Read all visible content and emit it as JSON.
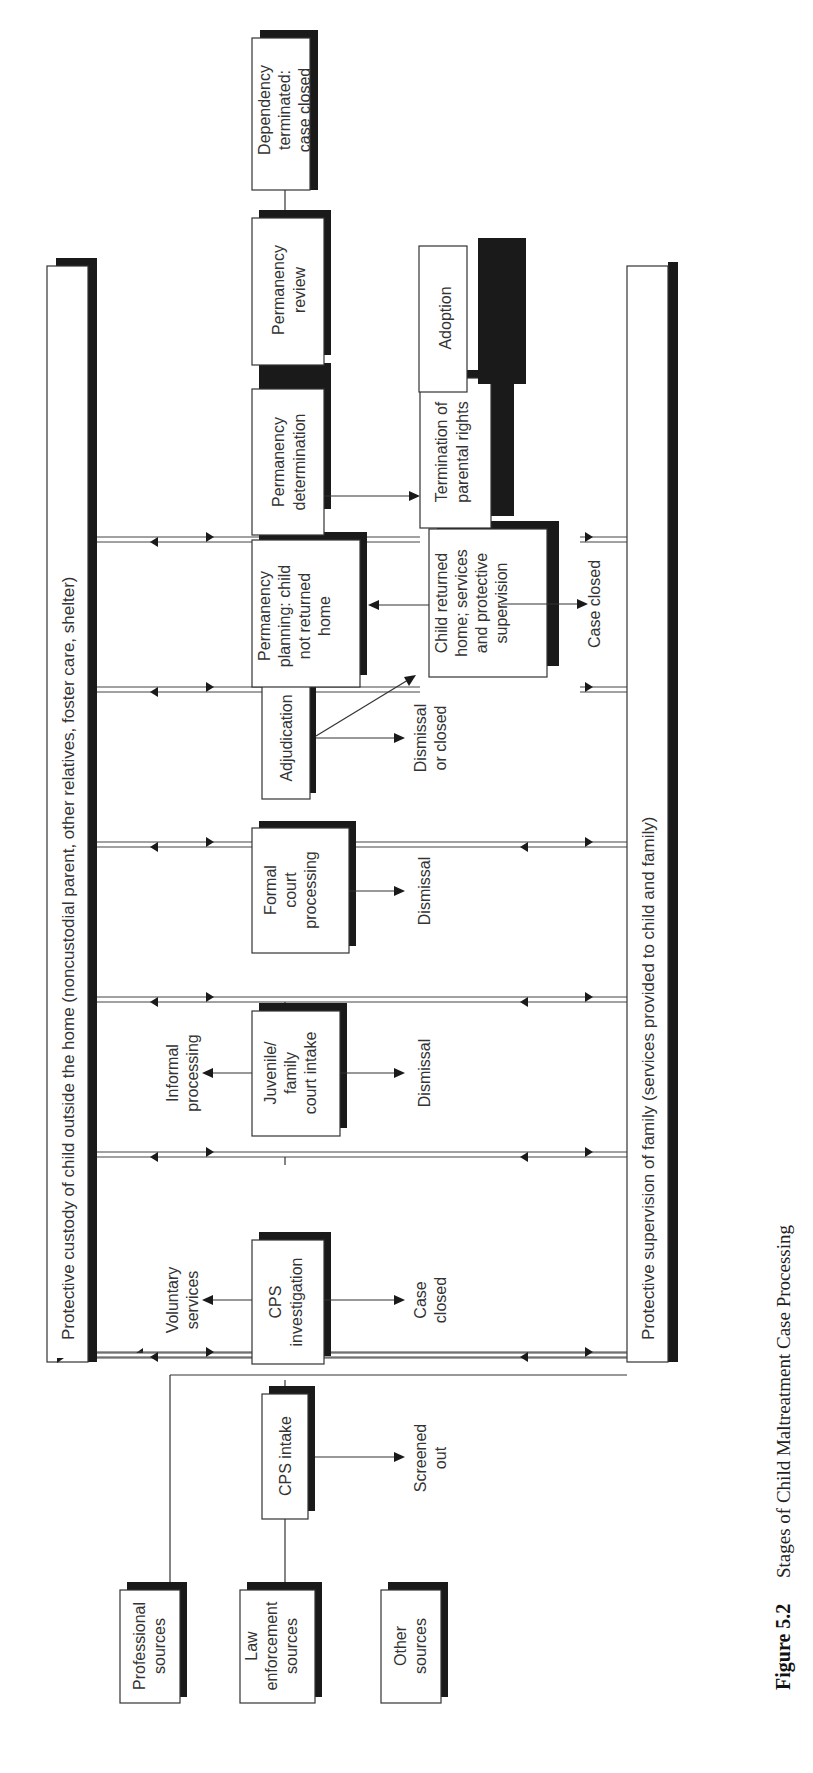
{
  "figure": {
    "number": "Figure 5.2",
    "caption": "Stages of Child Maltreatment Case Processing",
    "orientation": "rotated 90° counter-clockwise"
  },
  "bars": {
    "top": "Protective custody of child outside the home (noncustodial parent, other relatives, foster care, shelter)",
    "bottom": "Protective supervision of family (services provided to child and family)"
  },
  "sources": [
    {
      "line1": "Professional",
      "line2": "sources",
      "line3": ""
    },
    {
      "line1": "Law",
      "line2": "enforcement",
      "line3": "sources"
    },
    {
      "line1": "Other",
      "line2": "sources",
      "line3": ""
    }
  ],
  "stages": {
    "cps_intake": {
      "line1": "CPS intake"
    },
    "cps_investigation": {
      "line1": "CPS",
      "line2": "investigation"
    },
    "juvenile_court_intake": {
      "line1": "Juvenile/",
      "line2": "family",
      "line3": "court intake"
    },
    "formal_court_processing": {
      "line1": "Formal",
      "line2": "court",
      "line3": "processing"
    },
    "adjudication": {
      "line1": "Adjudication"
    },
    "permanency_planning": {
      "line1": "Permanency",
      "line2": "planning: child",
      "line3": "not returned",
      "line4": "home"
    },
    "permanency_determination": {
      "line1": "Permanency",
      "line2": "determination"
    },
    "permanency_review": {
      "line1": "Permanency",
      "line2": "review"
    },
    "dependency_terminated": {
      "line1": "Dependency",
      "line2": "terminated:",
      "line3": "case closed"
    },
    "child_returned_home": {
      "line1": "Child returned",
      "line2": "home; services",
      "line3": "and protective",
      "line4": "supervision"
    },
    "termination_parental_rights": {
      "line1": "Termination of",
      "line2": "parental rights"
    },
    "adoption": {
      "line1": "Adoption"
    }
  },
  "outcomes": {
    "screened_out": {
      "line1": "Screened",
      "line2": "out"
    },
    "case_closed_investigation": {
      "line1": "Case",
      "line2": "closed"
    },
    "voluntary_services": {
      "line1": "Voluntary",
      "line2": "services"
    },
    "informal_processing": {
      "line1": "Informal",
      "line2": "processing"
    },
    "dismissal_intake": {
      "line1": "Dismissal"
    },
    "dismissal_formal": {
      "line1": "Dismissal"
    },
    "dismissal_or_closed": {
      "line1": "Dismissal",
      "line2": "or closed"
    },
    "case_closed_returned": {
      "line1": "Case closed"
    }
  },
  "colors": {
    "line": "#333333",
    "shadow": "#1a1a1a",
    "background": "#ffffff"
  }
}
